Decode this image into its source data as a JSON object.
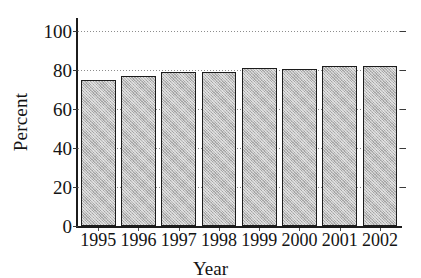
{
  "chart_data": {
    "type": "bar",
    "title": "",
    "xlabel": "Year",
    "ylabel": "Percent",
    "categories": [
      "1995",
      "1996",
      "1997",
      "1998",
      "1999",
      "2000",
      "2001",
      "2002"
    ],
    "values": [
      75,
      77,
      79,
      79,
      81,
      80.5,
      82,
      82
    ],
    "ylim": [
      0,
      100
    ],
    "yticks": [
      0,
      20,
      40,
      60,
      80,
      100
    ],
    "ytick_labels": [
      "0",
      "20",
      "40",
      "60",
      "80",
      "100"
    ],
    "grid": true,
    "grid_axis": "y",
    "grid_style": "dotted",
    "legend": null,
    "legend_position": "none",
    "series": [
      {
        "name": "Percent",
        "values": [
          75,
          77,
          79,
          79,
          81,
          80.5,
          82,
          82
        ]
      }
    ],
    "colors": {
      "bar_fill": "#bcbcbc",
      "bar_edge": "#1c1c1c",
      "grid": "#8d8d8d",
      "axis": "#1c1c1c",
      "text": "#141414",
      "background": "#ffffff"
    }
  }
}
